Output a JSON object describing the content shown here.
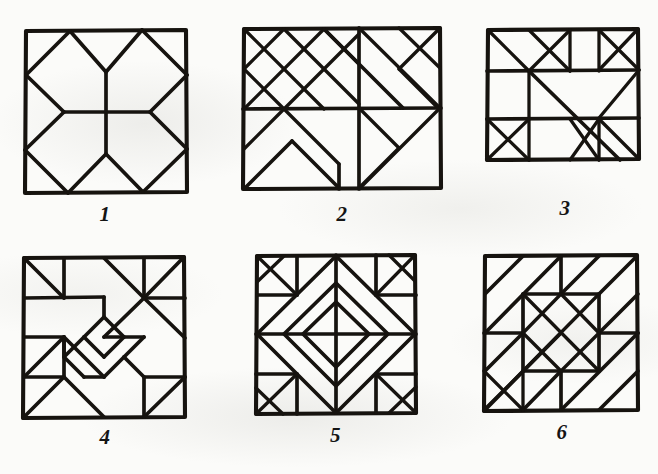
{
  "page": {
    "background_color": "#fbfbf9",
    "ink_color": "#16130f",
    "rows": 2,
    "columns": 3,
    "figure_count": 6
  },
  "figures": [
    {
      "id": "figure-1",
      "label": "1",
      "shape": "square",
      "row": 1,
      "column": 1,
      "x": 25,
      "y": 30,
      "w": 161,
      "h": 162,
      "motif": "octagon-with-central-stem",
      "description": "Square with all four corners chamfered by diagonals forming a central octagon, a vertical stem through the middle and a horizontal bar at mid-height."
    },
    {
      "id": "figure-2",
      "label": "2",
      "shape": "rectangle",
      "row": 1,
      "column": 2,
      "x": 243,
      "y": 28,
      "w": 196,
      "h": 160,
      "motif": "diagonal-lattice-with-chevron",
      "description": "Rectangle filled with a dense 45-degree diagonal lattice, a horizontal mid-line, a vertical divider right of centre and an open chevron in the lower-left quadrant."
    },
    {
      "id": "figure-3",
      "label": "3",
      "shape": "rectangle",
      "row": 1,
      "column": 3,
      "x": 488,
      "y": 30,
      "w": 150,
      "h": 130,
      "motif": "banded-rectangle-with-long-diagonal",
      "description": "Rectangle divided into three horizontal bands crossed by a long corner-to-corner diagonal, with triangles and X crossings in the upper and lower bands."
    },
    {
      "id": "figure-4",
      "label": "4",
      "shape": "square",
      "row": 2,
      "column": 1,
      "x": 24,
      "y": 258,
      "w": 160,
      "h": 160,
      "motif": "pinwheel-zigzag-knot",
      "description": "Square with corner triangles, two star hubs on a diagonal and an interlocking angular zigzag knot meandering through the centre."
    },
    {
      "id": "figure-5",
      "label": "5",
      "shape": "square",
      "row": 2,
      "column": 2,
      "x": 256,
      "y": 255,
      "w": 158,
      "h": 158,
      "motif": "concentric-diamond-in-square",
      "description": "Square containing a large rotated diamond with a smaller nested diamond and an internal cross at the centre, framed by corner squares holding small diagonals."
    },
    {
      "id": "figure-6",
      "label": "6",
      "shape": "square",
      "row": 2,
      "column": 3,
      "x": 485,
      "y": 255,
      "w": 152,
      "h": 155,
      "motif": "diagonal-bands-with-central-diamond-grid",
      "description": "Square with long parallel diagonal bands sweeping across the field and a central three-by-three block of crossed diagonals forming a diamond grid."
    }
  ]
}
